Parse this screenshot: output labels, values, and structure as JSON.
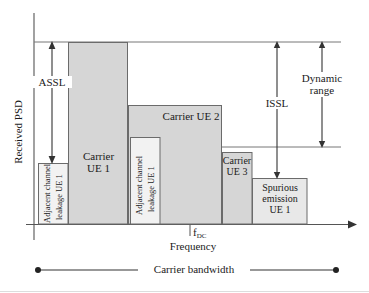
{
  "figure": {
    "type": "spectrum-psd-diagram",
    "axes": {
      "y_label": "Received PSD",
      "x_label": "Frequency",
      "x_tick_label": "f",
      "x_tick_sub": "DC"
    },
    "annotations": {
      "assl": "ASSL",
      "issl": "ISSL",
      "dynamic_range_line1": "Dynamic",
      "dynamic_range_line2": "range",
      "carrier_bandwidth": "Carrier bandwidth"
    },
    "blocks": [
      {
        "id": "acl-ue1-left",
        "label_line1": "Adjacent channel",
        "label_line2": "leakage UE 1",
        "x": 38,
        "w": 30,
        "top": 163,
        "fill": "#f2f2f2",
        "orientation": "vertical"
      },
      {
        "id": "carrier-ue1",
        "label_line1": "Carrier",
        "label_line2": "UE 1",
        "x": 68,
        "w": 60,
        "top": 42,
        "fill": "#d6d6d6",
        "orientation": "horizontal"
      },
      {
        "id": "acl-ue1-right",
        "label_line1": "Adjacent channel",
        "label_line2": "leakage UE 1",
        "x": 130,
        "w": 30,
        "top": 137,
        "fill": "#f2f2f2",
        "orientation": "vertical"
      },
      {
        "id": "carrier-ue2",
        "label_line1": "Carrier UE 2",
        "label_line2": "",
        "x": 128,
        "w": 94,
        "top": 105,
        "fill": "#d6d6d6",
        "orientation": "horizontal"
      },
      {
        "id": "carrier-ue3",
        "label_line1": "Carrier",
        "label_line2": "UE 3",
        "x": 222,
        "w": 30,
        "top": 152,
        "fill": "#d6d6d6",
        "orientation": "horizontal"
      },
      {
        "id": "spurious-ue1",
        "label_line1": "Spurious",
        "label_line2": "emission",
        "label_line3": "UE 1",
        "x": 252,
        "w": 55,
        "top": 178,
        "fill": "#e8e8e8",
        "orientation": "horizontal"
      }
    ],
    "colors": {
      "carrier_fill": "#d6d6d6",
      "leakage_fill": "#f2f2f2",
      "spurious_fill": "#e8e8e8",
      "stroke": "#555555",
      "axis": "#555555",
      "text": "#1a1a1a"
    },
    "geometry": {
      "baseline_y": 224,
      "top_reference_y": 42,
      "dynamic_reference_y": 147,
      "axis_x": 34
    }
  }
}
